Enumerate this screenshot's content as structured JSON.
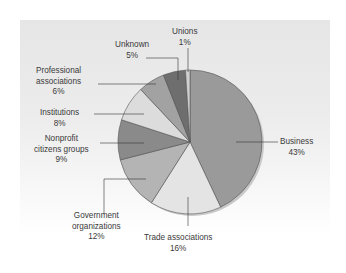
{
  "chart_data": {
    "type": "pie",
    "title": "",
    "categories": [
      "Business",
      "Trade associations",
      "Government organizations",
      "Nonprofit citizens groups",
      "Institutions",
      "Professional associations",
      "Unknown",
      "Unions"
    ],
    "values": [
      43,
      16,
      12,
      9,
      8,
      6,
      5,
      1
    ],
    "unit": "%",
    "start_angle": "12 o'clock",
    "direction": "clockwise",
    "colors": [
      "#9a9a9a",
      "#e4e4e4",
      "#b4b4b4",
      "#8a8a8a",
      "#dcdcdc",
      "#a2a2a2",
      "#6e6e6e",
      "#d0d0d0"
    ],
    "legend": "none (callout labels)"
  },
  "labels": [
    {
      "name": "Business",
      "lines": [
        "Business"
      ],
      "pct": "43%"
    },
    {
      "name": "Trade associations",
      "lines": [
        "Trade associations"
      ],
      "pct": "16%"
    },
    {
      "name": "Government organizations",
      "lines": [
        "Government",
        "organizations"
      ],
      "pct": "12%"
    },
    {
      "name": "Nonprofit citizens groups",
      "lines": [
        "Nonprofit",
        "citizens groups"
      ],
      "pct": "9%"
    },
    {
      "name": "Institutions",
      "lines": [
        "Institutions"
      ],
      "pct": "8%"
    },
    {
      "name": "Professional associations",
      "lines": [
        "Professional",
        "associations"
      ],
      "pct": "6%"
    },
    {
      "name": "Unknown",
      "lines": [
        "Unknown"
      ],
      "pct": "5%"
    },
    {
      "name": "Unions",
      "lines": [
        "Unions"
      ],
      "pct": "1%"
    }
  ]
}
